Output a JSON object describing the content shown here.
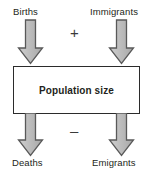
{
  "diagram": {
    "center": {
      "label": "Population size",
      "name": "population-box"
    },
    "operators": {
      "inflow_sign": "+",
      "outflow_sign": "–"
    },
    "inflows": [
      {
        "label": "Births",
        "icon": "down-block-arrow-icon",
        "side": "left"
      },
      {
        "label": "Immigrants",
        "icon": "down-block-arrow-icon",
        "side": "right"
      }
    ],
    "outflows": [
      {
        "label": "Deaths",
        "icon": "down-block-arrow-icon",
        "side": "left"
      },
      {
        "label": "Emigrants",
        "icon": "down-block-arrow-icon",
        "side": "right"
      }
    ],
    "colors": {
      "arrow_fill": "#b3b3b3",
      "arrow_fill_light": "#cfcfcf",
      "arrow_stroke": "#595959",
      "box_stroke": "#2b2b2b",
      "box_fill": "#ffffff",
      "text": "#231f20",
      "background": "#ffffff"
    }
  }
}
